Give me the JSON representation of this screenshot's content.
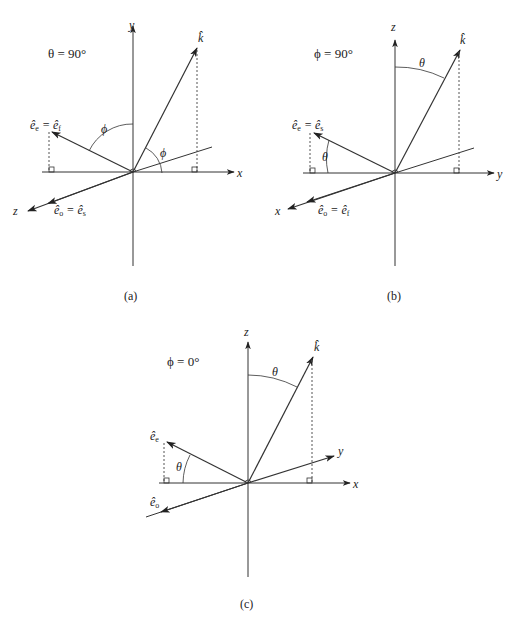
{
  "panels": [
    {
      "id": "a",
      "caption": "(a)",
      "condition": "θ = 90°",
      "axes": {
        "vertical": "y",
        "horizontal": "x",
        "oblique": "z"
      },
      "vectors": {
        "k": "k̂",
        "upper": "ê",
        "upper_sub": "e",
        "upper_eq": " = ",
        "upper_eq_vec": "ê",
        "upper_eq_sub": "f",
        "lower": "ê",
        "lower_sub": "o",
        "lower_eq": " = ",
        "lower_eq_vec": "ê",
        "lower_eq_sub": "s"
      },
      "angles": [
        "ϕ",
        "ϕ"
      ]
    },
    {
      "id": "b",
      "caption": "(b)",
      "condition": "ϕ = 90°",
      "axes": {
        "vertical": "z",
        "horizontal": "y",
        "oblique": "x"
      },
      "vectors": {
        "k": "k̂",
        "upper": "ê",
        "upper_sub": "e",
        "upper_eq": " = ",
        "upper_eq_vec": "ê",
        "upper_eq_sub": "s",
        "lower": "ê",
        "lower_sub": "o",
        "lower_eq": " = ",
        "lower_eq_vec": "ê",
        "lower_eq_sub": "f"
      },
      "angles": [
        "θ",
        "θ"
      ]
    },
    {
      "id": "c",
      "caption": "(c)",
      "condition": "ϕ = 0°",
      "axes": {
        "vertical": "z",
        "horizontal": "x",
        "oblique": "y"
      },
      "vectors": {
        "k": "k̂",
        "upper": "ê",
        "upper_sub": "e",
        "lower": "ê",
        "lower_sub": "o"
      },
      "angles": [
        "θ",
        "θ"
      ]
    }
  ]
}
